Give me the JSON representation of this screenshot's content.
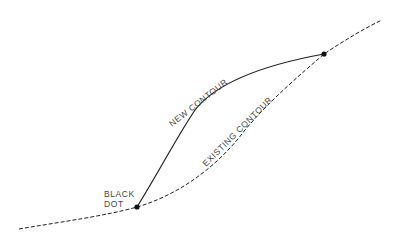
{
  "diagram": {
    "type": "contour-grading-sketch",
    "labels": {
      "new_contour": "NEW CONTOUR",
      "existing_contour": "EXISTING CONTOUR",
      "black_dot_line1": "BLACK",
      "black_dot_line2": "DOT"
    },
    "colors": {
      "line": "#222222",
      "text": "#444444",
      "background": "#ffffff"
    },
    "points": {
      "lower_dot": [
        137,
        207
      ],
      "upper_dot": [
        324,
        54
      ]
    }
  }
}
